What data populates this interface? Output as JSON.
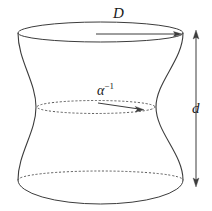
{
  "figure": {
    "type": "hyperboloid-geometry-diagram",
    "background_color": "#ffffff",
    "stroke_color": "#3c3c3c",
    "labels": {
      "diameter_top": "D",
      "height": "d",
      "waist_radius_base": "α",
      "waist_radius_exponent": "−1"
    },
    "annotations": {
      "top_diameter_arrow": "horizontal arrow spanning top circle",
      "waist_radius_arrow": "horizontal arrow from axis to waist rim",
      "height_arrow": "vertical double-headed arrow at right"
    },
    "geometry": {
      "top_ellipse": {
        "cx": 100.5,
        "cy": 33,
        "rx": 82.5,
        "ry": 8
      },
      "waist_ellipse": {
        "cx": 96,
        "cy": 107,
        "rx": 59,
        "ry": 6.5
      },
      "bottom_ellipse": {
        "cx": 100.5,
        "cy": 180,
        "rx": 82.5,
        "ry": 9
      },
      "height_arrow_x": 196,
      "height_arrow_top_y": 31,
      "height_arrow_bottom_y": 186
    }
  }
}
